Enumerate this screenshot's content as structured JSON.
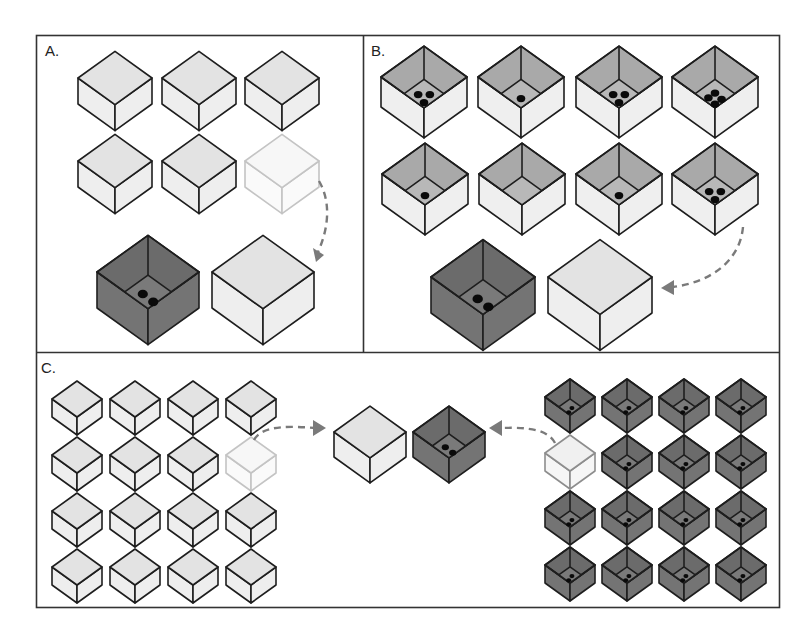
{
  "figure": {
    "colors": {
      "frame": "#333333",
      "stroke": "#1e1e1e",
      "light_top": "#e3e3e3",
      "light_side": "#eeeeee",
      "faded_stroke": "#c4c4c4",
      "open_rim": "#a9a9a9",
      "open_floor": "#b8b8b8",
      "open_side": "#efefef",
      "dark_top": "#6b6b6b",
      "dark_floor": "#7a7a7a",
      "dark_side": "#747474",
      "arrow": "#7a7a7a",
      "dot": "#0a0a0a"
    },
    "panels": [
      {
        "id": "A",
        "label": "A.",
        "label_pos": [
          45,
          42
        ],
        "boxes": [
          {
            "cx": 115,
            "cy": 78,
            "s": 37,
            "h": 26,
            "type": "closed"
          },
          {
            "cx": 199,
            "cy": 78,
            "s": 37,
            "h": 26,
            "type": "closed"
          },
          {
            "cx": 282,
            "cy": 78,
            "s": 37,
            "h": 26,
            "type": "closed"
          },
          {
            "cx": 115,
            "cy": 161,
            "s": 37,
            "h": 26,
            "type": "closed"
          },
          {
            "cx": 199,
            "cy": 161,
            "s": 37,
            "h": 26,
            "type": "closed"
          },
          {
            "cx": 282,
            "cy": 161,
            "s": 37,
            "h": 26,
            "type": "faded"
          },
          {
            "cx": 148,
            "cy": 272,
            "s": 51,
            "h": 36,
            "type": "dark",
            "dots": 2
          },
          {
            "cx": 263,
            "cy": 272,
            "s": 51,
            "h": 36,
            "type": "closed"
          }
        ],
        "arrows": [
          {
            "d": "M319,181 C330,200 330,225 318,252",
            "head": [
              [
                313,
                248
              ],
              [
                324,
                255
              ],
              [
                316,
                262
              ]
            ]
          }
        ]
      },
      {
        "id": "B",
        "label": "B.",
        "label_pos": [
          371,
          42
        ],
        "boxes": [
          {
            "cx": 424,
            "cy": 77,
            "s": 43,
            "h": 30,
            "type": "open",
            "dots": 3
          },
          {
            "cx": 521,
            "cy": 77,
            "s": 43,
            "h": 30,
            "type": "open",
            "dots": 1
          },
          {
            "cx": 619,
            "cy": 77,
            "s": 43,
            "h": 30,
            "type": "open",
            "dots": 3
          },
          {
            "cx": 715,
            "cy": 77,
            "s": 43,
            "h": 30,
            "type": "open",
            "dots": 4
          },
          {
            "cx": 425,
            "cy": 174,
            "s": 43,
            "h": 30,
            "type": "open",
            "dots": 1
          },
          {
            "cx": 522,
            "cy": 174,
            "s": 43,
            "h": 30,
            "type": "open",
            "dots": 0
          },
          {
            "cx": 619,
            "cy": 174,
            "s": 43,
            "h": 30,
            "type": "open",
            "dots": 1
          },
          {
            "cx": 715,
            "cy": 174,
            "s": 43,
            "h": 30,
            "type": "open",
            "dots": 3
          },
          {
            "cx": 483,
            "cy": 277,
            "s": 52,
            "h": 36,
            "type": "dark",
            "dots": 2
          },
          {
            "cx": 600,
            "cy": 277,
            "s": 52,
            "h": 36,
            "type": "closed"
          }
        ],
        "arrows": [
          {
            "d": "M743,227 C740,260 712,282 673,287",
            "head": [
              [
                674,
                280
              ],
              [
                661,
                288
              ],
              [
                674,
                295
              ]
            ]
          }
        ]
      },
      {
        "id": "C",
        "label": "C.",
        "label_pos": [
          41,
          359
        ],
        "grids": [
          {
            "x0": 77,
            "y0": 399,
            "dx": 58,
            "dy": 56,
            "cols": 4,
            "rows": 4,
            "s": 25,
            "h": 18,
            "type": "closed",
            "faded_index": 7
          },
          {
            "x0": 570,
            "y0": 397,
            "dx": 57,
            "dy": 56,
            "cols": 4,
            "rows": 4,
            "s": 25,
            "h": 18,
            "type": "dark",
            "dots": 2,
            "faded_index": 4
          }
        ],
        "boxes": [
          {
            "cx": 370,
            "cy": 432,
            "s": 36,
            "h": 25,
            "type": "closed"
          },
          {
            "cx": 449,
            "cy": 432,
            "s": 36,
            "h": 25,
            "type": "dark",
            "dots": 2
          }
        ],
        "arrows": [
          {
            "d": "M254,440 C262,425 290,426 315,428",
            "head": [
              [
                313,
                420
              ],
              [
                326,
                428
              ],
              [
                313,
                436
              ]
            ]
          },
          {
            "d": "M555,443 C548,430 530,427 502,428",
            "head": [
              [
                502,
                420
              ],
              [
                489,
                428
              ],
              [
                502,
                436
              ]
            ]
          }
        ]
      }
    ]
  }
}
